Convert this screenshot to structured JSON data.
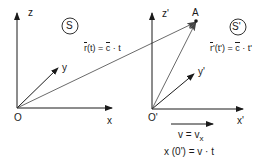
{
  "frame_S": {
    "label": "S",
    "axes": {
      "z": "z",
      "y": "y",
      "x": "x"
    },
    "origin": "O",
    "position_vector": {
      "lhs": "r",
      "arg": "(t)",
      "eq": " = ",
      "rhs": "c",
      "tail": " · t"
    }
  },
  "frame_S_prime": {
    "label": "S'",
    "axes": {
      "z": "z'",
      "y": "y'",
      "x": "x'"
    },
    "origin": "O'",
    "position_vector": {
      "lhs": "r",
      "arg": "'(t')",
      "eq": " = ",
      "rhs": "c",
      "tail": " · t'"
    }
  },
  "point": {
    "label": "A"
  },
  "velocity": {
    "line1": "v = v",
    "line1_sub": "x",
    "line2": "x (0') = v · t"
  },
  "colors": {
    "stroke": "#1a1a1a",
    "thin": "#444444",
    "background": "#ffffff"
  }
}
